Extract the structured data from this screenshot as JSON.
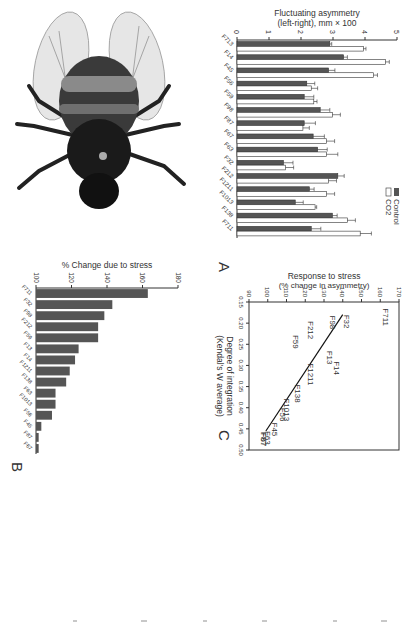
{
  "figure": {
    "panel_letters": {
      "a": "A",
      "b": "B",
      "c": "C"
    },
    "colors": {
      "control": "#555555",
      "co2": "#ffffff",
      "bar_b": "#555555",
      "axis": "#333333"
    }
  },
  "chart_data": [
    {
      "id": "A",
      "type": "bar",
      "title": "",
      "xlabel": "",
      "ylabel": "Fluctuating asymmetry (left-right), mm × 100",
      "ylim": [
        0,
        5
      ],
      "yticks": [
        0,
        1,
        2,
        3,
        4,
        5
      ],
      "categories": [
        "F713",
        "F14",
        "F45",
        "F56",
        "F59",
        "F98",
        "F87",
        "F67",
        "F63",
        "F32",
        "F212",
        "F1211",
        "F1013",
        "F138",
        "F711"
      ],
      "series": [
        {
          "name": "Control",
          "values": [
            2.9,
            3.33,
            2.86,
            2.18,
            2.1,
            2.6,
            2.1,
            2.38,
            2.52,
            1.45,
            3.15,
            2.26,
            1.82,
            2.98,
            2.32
          ],
          "errors": [
            0.06,
            0.12,
            0.2,
            0.25,
            0.3,
            0.3,
            0.35,
            0.35,
            0.3,
            0.3,
            0.2,
            0.15,
            0.25,
            0.15,
            0.3
          ]
        },
        {
          "name": "CO2",
          "values": [
            3.95,
            4.64,
            4.27,
            2.32,
            2.4,
            2.98,
            2.06,
            2.8,
            2.8,
            1.52,
            2.86,
            2.8,
            2.44,
            3.45,
            3.85
          ],
          "errors": [
            0.08,
            0.12,
            0.12,
            0.2,
            0.1,
            0.25,
            0.2,
            0.25,
            0.35,
            0.25,
            0.25,
            0.25,
            0.05,
            0.25,
            0.35
          ]
        }
      ],
      "legend": [
        "Control",
        "CO2"
      ],
      "legend_position": "top-right"
    },
    {
      "id": "B",
      "type": "bar",
      "title": "",
      "xlabel": "",
      "ylabel": "% Change due to stress",
      "ylim": [
        100,
        180
      ],
      "yticks": [
        100,
        120,
        140,
        160,
        180
      ],
      "categories": [
        "F711",
        "F32",
        "F98",
        "F212",
        "F59",
        "F13",
        "F14",
        "F1211",
        "F138",
        "F63",
        "F1013",
        "F56",
        "F45",
        "F87",
        "F67"
      ],
      "values": [
        163,
        143,
        138.5,
        135,
        135,
        124,
        122,
        119,
        117,
        111,
        111,
        109,
        103,
        101.5,
        101.5
      ]
    },
    {
      "id": "C",
      "type": "scatter",
      "title": "",
      "xlabel": "Degree of integration (Kendal's W average)",
      "ylabel": "Response to stress (% change in asymmetry)",
      "xlim": [
        0.15,
        0.5
      ],
      "ylim": [
        90,
        170
      ],
      "xticks": [
        "0.15",
        "0.20",
        "0.25",
        "0.30",
        "0.35",
        "0.40",
        "0.45",
        "0.50"
      ],
      "yticks": [
        "90",
        "100",
        "110",
        "120",
        "130",
        "140",
        "150",
        "160",
        "170"
      ],
      "points": [
        {
          "label": "F711",
          "x": 0.165,
          "y": 163
        },
        {
          "label": "F32",
          "x": 0.18,
          "y": 142
        },
        {
          "label": "F98",
          "x": 0.182,
          "y": 135
        },
        {
          "label": "F212",
          "x": 0.195,
          "y": 123
        },
        {
          "label": "F59",
          "x": 0.228,
          "y": 115
        },
        {
          "label": "F13",
          "x": 0.265,
          "y": 133
        },
        {
          "label": "F14",
          "x": 0.29,
          "y": 137
        },
        {
          "label": "F1211",
          "x": 0.295,
          "y": 123
        },
        {
          "label": "F138",
          "x": 0.345,
          "y": 116
        },
        {
          "label": "F1013",
          "x": 0.378,
          "y": 110
        },
        {
          "label": "F56",
          "x": 0.4,
          "y": 108
        },
        {
          "label": "F45",
          "x": 0.435,
          "y": 104
        },
        {
          "label": "F63",
          "x": 0.455,
          "y": 100
        },
        {
          "label": "F87",
          "x": 0.457,
          "y": 98
        },
        {
          "label": "F67",
          "x": 0.459,
          "y": 98
        }
      ],
      "fit_line": {
        "x": [
          0.18,
          0.455
        ],
        "y": [
          140,
          99
        ]
      }
    }
  ]
}
